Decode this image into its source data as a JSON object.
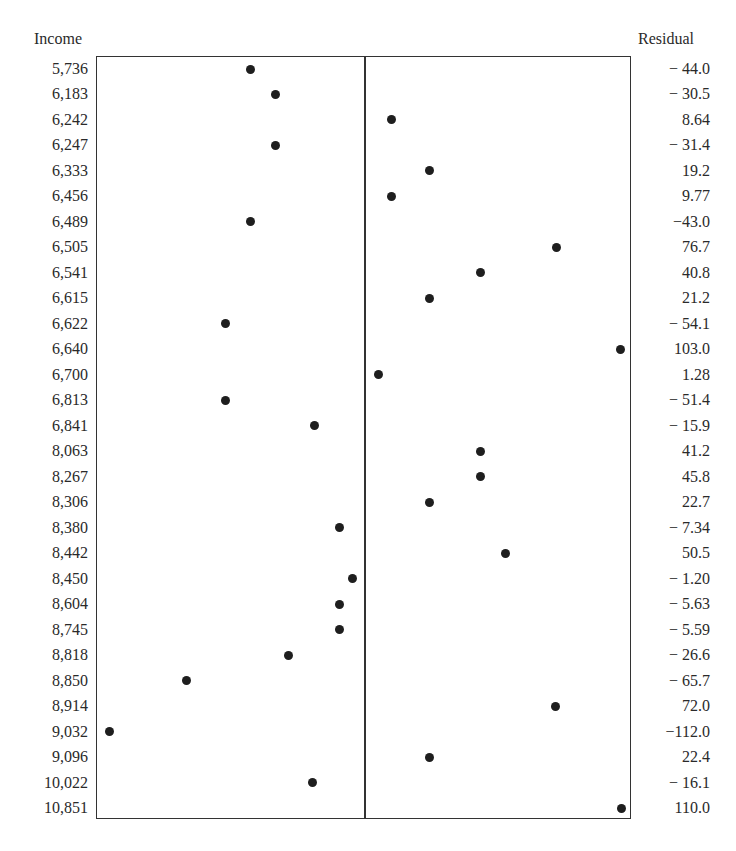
{
  "chart_data": {
    "type": "scatter",
    "title": "",
    "left_axis_label": "Income",
    "right_axis_label": "Residual",
    "xlabel": "Residual (centered at 0)",
    "ylabel": "Income",
    "center_line": 0,
    "grid": false,
    "rows": [
      {
        "income": "5,736",
        "residual": "− 44.0",
        "value": -44.0,
        "px": 250
      },
      {
        "income": "6,183",
        "residual": "− 30.5",
        "value": -30.5,
        "px": 275
      },
      {
        "income": "6,242",
        "residual": "8.64",
        "value": 8.64,
        "px": 391
      },
      {
        "income": "6,247",
        "residual": "− 31.4",
        "value": -31.4,
        "px": 275
      },
      {
        "income": "6,333",
        "residual": "19.2",
        "value": 19.2,
        "px": 429
      },
      {
        "income": "6,456",
        "residual": "9.77",
        "value": 9.77,
        "px": 391
      },
      {
        "income": "6,489",
        "residual": "−43.0",
        "value": -43.0,
        "px": 250
      },
      {
        "income": "6,505",
        "residual": "76.7",
        "value": 76.7,
        "px": 556
      },
      {
        "income": "6,541",
        "residual": "40.8",
        "value": 40.8,
        "px": 480
      },
      {
        "income": "6,615",
        "residual": "21.2",
        "value": 21.2,
        "px": 429
      },
      {
        "income": "6,622",
        "residual": "− 54.1",
        "value": -54.1,
        "px": 225
      },
      {
        "income": "6,640",
        "residual": "103.0",
        "value": 103.0,
        "px": 620
      },
      {
        "income": "6,700",
        "residual": "1.28",
        "value": 1.28,
        "px": 378
      },
      {
        "income": "6,813",
        "residual": "− 51.4",
        "value": -51.4,
        "px": 225
      },
      {
        "income": "6,841",
        "residual": "− 15.9",
        "value": -15.9,
        "px": 314
      },
      {
        "income": "8,063",
        "residual": "41.2",
        "value": 41.2,
        "px": 480
      },
      {
        "income": "8,267",
        "residual": "45.8",
        "value": 45.8,
        "px": 480
      },
      {
        "income": "8,306",
        "residual": "22.7",
        "value": 22.7,
        "px": 429
      },
      {
        "income": "8,380",
        "residual": "− 7.34",
        "value": -7.34,
        "px": 339
      },
      {
        "income": "8,442",
        "residual": "50.5",
        "value": 50.5,
        "px": 505
      },
      {
        "income": "8,450",
        "residual": "− 1.20",
        "value": -1.2,
        "px": 352
      },
      {
        "income": "8,604",
        "residual": "− 5.63",
        "value": -5.63,
        "px": 339
      },
      {
        "income": "8,745",
        "residual": "− 5.59",
        "value": -5.59,
        "px": 339
      },
      {
        "income": "8,818",
        "residual": "− 26.6",
        "value": -26.6,
        "px": 288
      },
      {
        "income": "8,850",
        "residual": "− 65.7",
        "value": -65.7,
        "px": 186
      },
      {
        "income": "8,914",
        "residual": "72.0",
        "value": 72.0,
        "px": 555
      },
      {
        "income": "9,032",
        "residual": "−112.0",
        "value": -112.0,
        "px": 109
      },
      {
        "income": "9,096",
        "residual": "22.4",
        "value": 22.4,
        "px": 429
      },
      {
        "income": "10,022",
        "residual": "− 16.1",
        "value": -16.1,
        "px": 312
      },
      {
        "income": "10,851",
        "residual": "110.0",
        "value": 110.0,
        "px": 621
      }
    ],
    "categories": [
      "5,736",
      "6,183",
      "6,242",
      "6,247",
      "6,333",
      "6,456",
      "6,489",
      "6,505",
      "6,541",
      "6,615",
      "6,622",
      "6,640",
      "6,700",
      "6,813",
      "6,841",
      "8,063",
      "8,267",
      "8,306",
      "8,380",
      "8,442",
      "8,450",
      "8,604",
      "8,745",
      "8,818",
      "8,850",
      "8,914",
      "9,032",
      "9,096",
      "10,022",
      "10,851"
    ],
    "values": [
      -44.0,
      -30.5,
      8.64,
      -31.4,
      19.2,
      9.77,
      -43.0,
      76.7,
      40.8,
      21.2,
      -54.1,
      103.0,
      1.28,
      -51.4,
      -15.9,
      41.2,
      45.8,
      22.7,
      -7.34,
      50.5,
      -1.2,
      -5.63,
      -5.59,
      -26.6,
      -65.7,
      72.0,
      -112.0,
      22.4,
      -16.1,
      110.0
    ],
    "xlim": [
      -115,
      115
    ]
  }
}
